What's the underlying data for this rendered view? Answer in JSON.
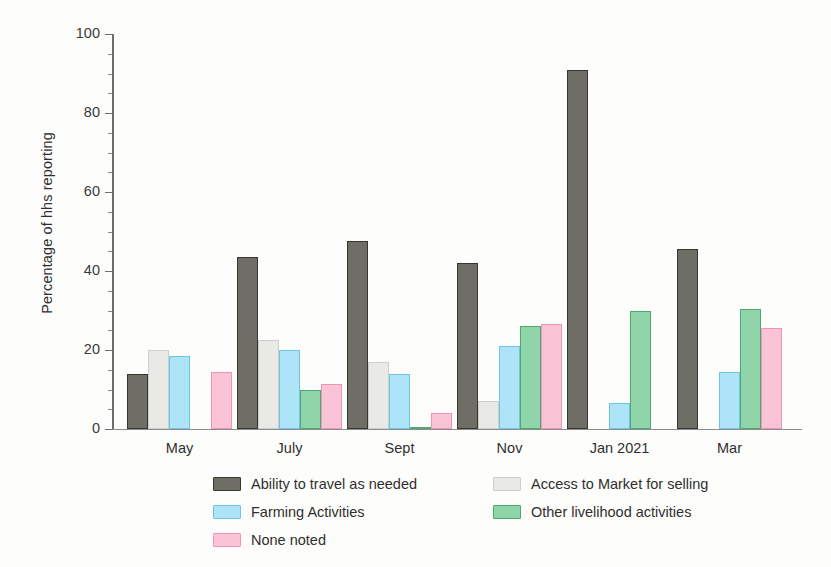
{
  "chart_data": {
    "type": "bar",
    "title": "",
    "xlabel": "",
    "ylabel": "Percentage of hhs reporting",
    "ylim": [
      0,
      100
    ],
    "yticks": [
      0,
      20,
      40,
      60,
      80,
      100
    ],
    "ytick_labels": [
      "0",
      "20",
      "40",
      "60",
      "80",
      "100"
    ],
    "grid": false,
    "legend_position": "bottom",
    "categories": [
      "May",
      "July",
      "Sept",
      "Nov",
      "Jan 2021",
      "Mar"
    ],
    "series": [
      {
        "name": "Ability to travel as needed",
        "color": "#6e6e66",
        "values": [
          14,
          43.5,
          47.5,
          42,
          91,
          45.5
        ]
      },
      {
        "name": "Access to Market for selling",
        "color": "#e9e9e6",
        "values": [
          20,
          22.5,
          17,
          7,
          0,
          0
        ]
      },
      {
        "name": "Farming Activities",
        "color": "#aee4f7",
        "values": [
          18.5,
          20,
          14,
          21,
          6.5,
          14.5
        ]
      },
      {
        "name": "Other livelihood activities",
        "color": "#90d5a9",
        "values": [
          0,
          10,
          0.3,
          26,
          30,
          30.5
        ]
      },
      {
        "name": "None noted",
        "color": "#fac3d6",
        "values": [
          14.5,
          11.5,
          4,
          26.5,
          0,
          25.5
        ]
      }
    ]
  }
}
